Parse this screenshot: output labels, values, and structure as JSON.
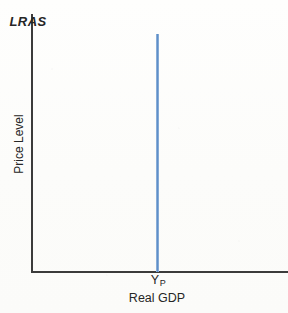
{
  "chart_data": {
    "type": "line",
    "title": "",
    "subtitle": "",
    "xlabel": "Real GDP",
    "ylabel": "Price Level",
    "grid": false,
    "legend": "none",
    "annotations": [
      {
        "name": "curve-label",
        "text": "LRAS",
        "position": "top-of-curve"
      },
      {
        "name": "x-tick-label",
        "text": "Yp",
        "position": "x-axis-at-curve"
      }
    ],
    "axis_ranges": {
      "xlim": [
        0,
        1
      ],
      "ylim": [
        0,
        1
      ]
    },
    "tick_labels": {
      "x": [
        "Yp"
      ],
      "y": []
    },
    "series": [
      {
        "name": "LRAS",
        "description": "Long-Run Aggregate Supply: vertical line at potential output",
        "color": "#5f8fc8",
        "x": [
          0.53,
          0.53
        ],
        "y": [
          0.0,
          1.0
        ]
      }
    ],
    "colors": {
      "lras_curve": "#5f8fc8",
      "lras_curve_edge": "#a8c4e4",
      "axis": "#3b3b3b",
      "text": "#262626",
      "background": "#fdfdfc"
    }
  },
  "labels": {
    "curve": "LRAS",
    "y_axis": "Price Level",
    "x_axis": "Real GDP",
    "potential_output_symbol": "Y",
    "potential_output_subscript": "P"
  }
}
